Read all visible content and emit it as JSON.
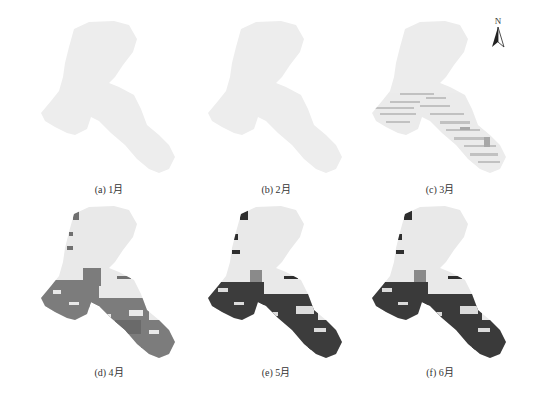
{
  "figure": {
    "north_arrow": {
      "label": "N",
      "icon": "north-arrow-icon"
    },
    "panels": [
      {
        "id": "a",
        "caption": "(a) 1月",
        "month": 1,
        "fill_level": "none"
      },
      {
        "id": "b",
        "caption": "(b) 2月",
        "month": 2,
        "fill_level": "none"
      },
      {
        "id": "c",
        "caption": "(c) 3月",
        "month": 3,
        "fill_level": "light"
      },
      {
        "id": "d",
        "caption": "(d) 4月",
        "month": 4,
        "fill_level": "medium"
      },
      {
        "id": "e",
        "caption": "(e) 5月",
        "month": 5,
        "fill_level": "heavy"
      },
      {
        "id": "f",
        "caption": "(f) 6月",
        "month": 6,
        "fill_level": "heavy"
      }
    ],
    "colors": {
      "base_region": "#ececec",
      "light_pattern": "#b8b8b8",
      "medium_pattern": "#7a7a7a",
      "dark_pattern": "#3a3a3a"
    }
  }
}
